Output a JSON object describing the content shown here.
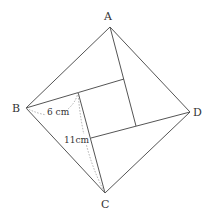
{
  "diagram": {
    "type": "geometry",
    "vertices": {
      "A": {
        "label": "A",
        "x": 110,
        "y": 27
      },
      "B": {
        "label": "B",
        "x": 26,
        "y": 108
      },
      "C": {
        "label": "C",
        "x": 105,
        "y": 193
      },
      "D": {
        "label": "D",
        "x": 190,
        "y": 112
      }
    },
    "inner_square": [
      {
        "x": 78,
        "y": 92
      },
      {
        "x": 124,
        "y": 79
      },
      {
        "x": 136,
        "y": 126
      },
      {
        "x": 91,
        "y": 138
      }
    ],
    "measurements": {
      "short_leg": "6 cm",
      "long_leg": "11cm"
    },
    "colors": {
      "line": "#555555",
      "text": "#333333",
      "dotted": "#999999"
    }
  }
}
